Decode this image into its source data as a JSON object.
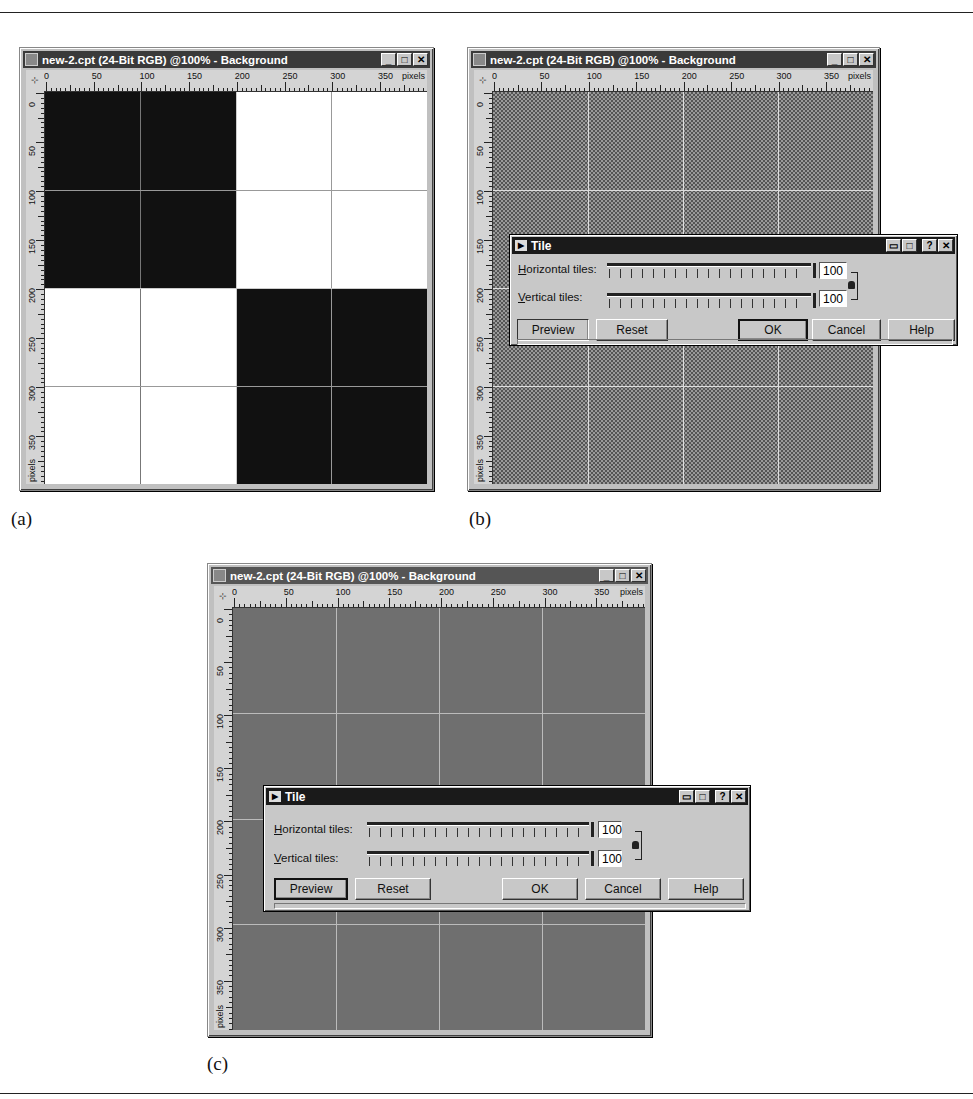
{
  "figure": {
    "captions": [
      "(a)",
      "(b)",
      "(c)"
    ]
  },
  "image_window": {
    "title": "new-2.cpt (24-Bit RGB) @100% - Background",
    "controls": {
      "minimize": "_",
      "maximize": "□",
      "close": "✕"
    },
    "ruler": {
      "corner_icon": "ruler-origin-icon",
      "h_labels": [
        "0",
        "50",
        "100",
        "150",
        "200",
        "250",
        "300",
        "350"
      ],
      "h_unit": "pixels",
      "v_labels": [
        "0",
        "50",
        "100",
        "150",
        "200",
        "250",
        "300",
        "350"
      ],
      "v_unit": "pixels"
    }
  },
  "panels": [
    {
      "id": "a",
      "canvas": "2x2 checkerboard: black top-left and bottom-right, white top-right and bottom-left",
      "has_dialog": false
    },
    {
      "id": "b",
      "canvas": "fine checker pattern (100x100 tiles)",
      "has_dialog": true
    },
    {
      "id": "c",
      "canvas": "solid mid-gray preview",
      "has_dialog": true
    }
  ],
  "tile_dialog": {
    "title": "Tile",
    "title_icon": "play-arrow-icon",
    "title_buttons": {
      "roll_up": "▭▭",
      "maximize": "□",
      "help": "?",
      "close": "✕"
    },
    "horizontal_label_accel": "H",
    "horizontal_label_rest": "orizontal tiles:",
    "vertical_label_accel": "V",
    "vertical_label_rest": "ertical tiles:",
    "horizontal_value": "100",
    "vertical_value": "100",
    "lock_icon": "lock-icon",
    "buttons": {
      "preview": "Preview",
      "reset": "Reset",
      "ok": "OK",
      "cancel": "Cancel",
      "help": "Help"
    }
  }
}
